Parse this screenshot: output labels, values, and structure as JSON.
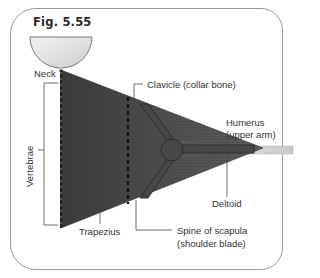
{
  "figure": {
    "title": "Fig. 5.55",
    "labels": {
      "neck": "Neck",
      "vertebrae": "Vertebrae",
      "clavicle": "Clavicle (collar bone)",
      "humerus_line1": "Humerus",
      "humerus_line2": "(upper arm)",
      "deltoid": "Deltoid",
      "trapezius": "Trapezius",
      "spine_line1": "Spine of scapula",
      "spine_line2": "(shoulder blade)"
    },
    "colors": {
      "muscle": "#4a4a4a",
      "head": "#e4e4e4",
      "bone": "#d0d0d0",
      "frame": "#9a9a9a",
      "leader": "#444444"
    }
  }
}
